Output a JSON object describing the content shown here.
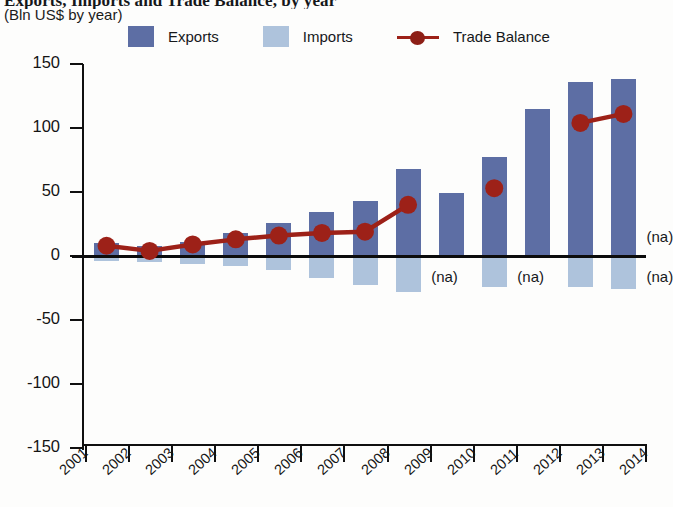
{
  "header": {
    "title": "Exports, Imports and Trade Balance, by year",
    "subtitle": "(Bln US$ by year)"
  },
  "legend": {
    "items": [
      {
        "label": "Exports",
        "color": "#5d6ea4",
        "marker": "square-swatch"
      },
      {
        "label": "Imports",
        "color": "#aec3dc",
        "marker": "square-swatch"
      },
      {
        "label": "Trade Balance",
        "color": "#9d2118",
        "marker": "line-with-dot"
      }
    ]
  },
  "annotations": {
    "na_label": "(na)",
    "na_points": [
      {
        "year": "2009",
        "series": "Imports"
      },
      {
        "year": "2011",
        "series": "Imports"
      },
      {
        "year": "2014",
        "series": "Exports"
      },
      {
        "year": "2014",
        "series": "Imports"
      }
    ]
  },
  "chart_data": {
    "type": "bar",
    "title": "Exports, Imports and Trade Balance, by year",
    "subtitle": "(Bln US$ by year)",
    "xlabel": "",
    "ylabel": "(Bln US$ by year)",
    "ylim": [
      -150,
      150
    ],
    "yticks": [
      150,
      100,
      50,
      0,
      -50,
      -100,
      -150
    ],
    "ytick_labels": [
      "150",
      "100",
      "50",
      "0",
      "-50",
      "-100",
      "-150"
    ],
    "grid": false,
    "legend_position": "top",
    "categories": [
      "2001",
      "2002",
      "2003",
      "2004",
      "2005",
      "2006",
      "2007",
      "2008",
      "2009",
      "2010",
      "2011",
      "2012",
      "2013",
      "2014"
    ],
    "series": [
      {
        "name": "Exports",
        "type": "bar",
        "color": "#5d6ea4",
        "values": [
          10,
          8,
          11,
          18,
          26,
          34,
          43,
          68,
          49,
          77,
          115,
          136,
          138,
          null
        ]
      },
      {
        "name": "Imports",
        "type": "bar",
        "color": "#aec3dc",
        "note": "plotted below the zero line as negative magnitudes",
        "values": [
          -4,
          -5,
          -6,
          -8,
          -11,
          -17,
          -23,
          -28,
          null,
          -24,
          null,
          -24,
          -26,
          null
        ]
      },
      {
        "name": "Trade Balance",
        "type": "line",
        "color": "#9d2118",
        "values": [
          8,
          4,
          9,
          13,
          16,
          18,
          19,
          40,
          null,
          53,
          null,
          104,
          111,
          null
        ]
      }
    ]
  }
}
